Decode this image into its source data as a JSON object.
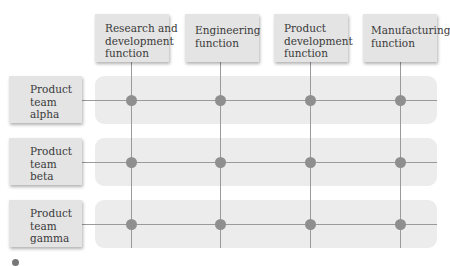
{
  "diagram": {
    "type": "matrix-organization",
    "columns": [
      {
        "id": "rd",
        "lines": [
          "Research and",
          "development",
          "function"
        ]
      },
      {
        "id": "eng",
        "lines": [
          "Engineering",
          "function"
        ]
      },
      {
        "id": "pd",
        "lines": [
          "Product",
          "development",
          "function"
        ]
      },
      {
        "id": "mfg",
        "lines": [
          "Manufacturing",
          "function"
        ]
      }
    ],
    "rows": [
      {
        "id": "alpha",
        "lines": [
          "Product",
          "team",
          "alpha"
        ]
      },
      {
        "id": "beta",
        "lines": [
          "Product",
          "team",
          "beta"
        ]
      },
      {
        "id": "gamma",
        "lines": [
          "Product",
          "team",
          "gamma"
        ]
      }
    ],
    "intersections": "every row connects to every column (12 nodes)",
    "colors": {
      "box_fill": "#e4e4e4",
      "band_fill": "#ececec",
      "line": "#9a9a9a",
      "node": "#8f8f8f",
      "text": "#3a3a3a"
    }
  }
}
